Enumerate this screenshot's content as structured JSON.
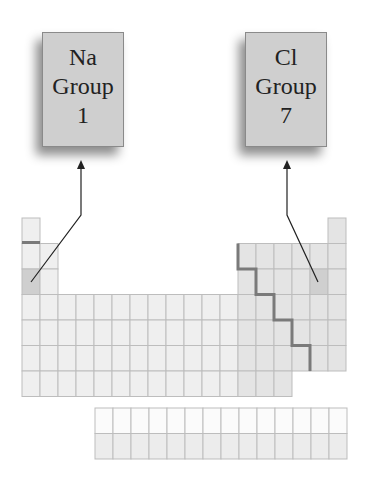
{
  "labels": {
    "na": {
      "symbol": "Na",
      "group_word": "Group",
      "group_number": "1"
    },
    "cl": {
      "symbol": "Cl",
      "group_word": "Group",
      "group_number": "7"
    }
  },
  "colors": {
    "cell_fill": "#efefef",
    "cell_fill_p_block": "#e4e4e4",
    "cell_border": "#bdbdbd",
    "highlight_cell": "#cfcfcf",
    "staircase": "#7a7a7a",
    "arrow": "#222222",
    "box_fill": "#cfcfcf"
  },
  "table": {
    "cell_width": 18,
    "cell_height": 25.5,
    "origin_x": 22,
    "origin_y": 218,
    "columns": 18,
    "rows": 7,
    "highlighted": [
      {
        "element": "Na",
        "row": 3,
        "col": 1
      },
      {
        "element": "Cl",
        "row": 3,
        "col": 17
      }
    ],
    "f_block": {
      "x": 95,
      "y": 408,
      "columns": 14,
      "rows": 2
    }
  }
}
